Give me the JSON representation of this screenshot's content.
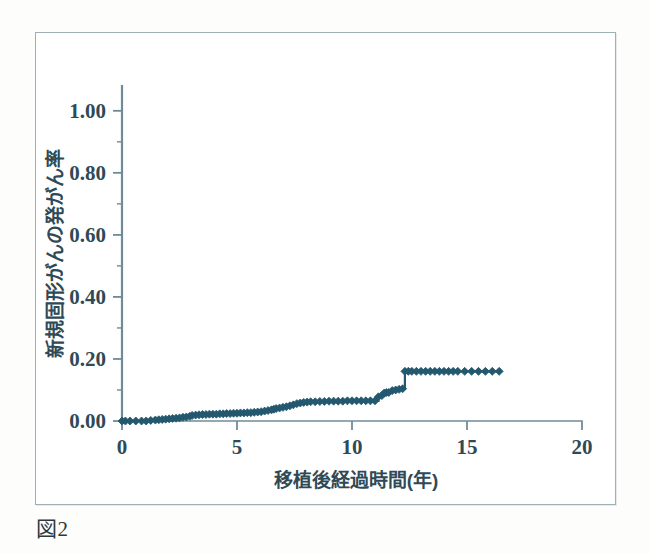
{
  "figure": {
    "caption": "図2"
  },
  "chart_data": {
    "type": "line",
    "subtype": "cumulative-incidence-step",
    "title": "",
    "subtitle": "",
    "xlabel": "移植後経過時間(年)",
    "ylabel": "新規固形がんの発がん率",
    "xlim": [
      0,
      20
    ],
    "ylim": [
      0.0,
      1.08
    ],
    "xticks": [
      0,
      5,
      10,
      15,
      20
    ],
    "xtick_labels": [
      "0",
      "5",
      "10",
      "15",
      "20"
    ],
    "yticks": [
      0.0,
      0.2,
      0.4,
      0.6,
      0.8,
      1.0
    ],
    "ytick_labels": [
      "0.00",
      "0.20",
      "0.40",
      "0.60",
      "0.80",
      "1.00"
    ],
    "yminor_ticks": [
      0.1,
      0.3,
      0.5,
      0.7,
      0.9
    ],
    "grid": false,
    "legend": null,
    "legend_position": "none",
    "marker": "diamond",
    "marker_size": 4,
    "line_width": 2.2,
    "series_color": "#23586f",
    "axis_color": "#6f8b96",
    "series": [
      {
        "name": "新規固形がんの累積発がん率",
        "x": [
          0.0,
          0.15,
          0.35,
          0.6,
          0.85,
          1.05,
          1.25,
          1.45,
          1.6,
          1.75,
          1.9,
          2.05,
          2.2,
          2.35,
          2.5,
          2.65,
          2.8,
          2.95,
          3.05,
          3.2,
          3.35,
          3.5,
          3.65,
          3.8,
          3.95,
          4.1,
          4.25,
          4.4,
          4.55,
          4.7,
          4.85,
          5.0,
          5.15,
          5.3,
          5.45,
          5.6,
          5.75,
          5.9,
          6.05,
          6.2,
          6.35,
          6.5,
          6.6,
          6.7,
          6.85,
          7.0,
          7.15,
          7.3,
          7.45,
          7.6,
          7.75,
          7.9,
          8.05,
          8.2,
          8.4,
          8.6,
          8.8,
          9.0,
          9.2,
          9.4,
          9.6,
          9.8,
          10.0,
          10.2,
          10.4,
          10.6,
          10.8,
          11.0,
          11.15,
          11.3,
          11.4,
          11.5,
          11.6,
          11.75,
          11.9,
          12.05,
          12.2,
          12.3,
          12.45,
          12.6,
          12.8,
          13.0,
          13.2,
          13.4,
          13.6,
          13.8,
          14.0,
          14.2,
          14.4,
          14.6,
          14.9,
          15.2,
          15.5,
          15.8,
          16.1,
          16.4
        ],
        "y": [
          0.0,
          0.0,
          0.0,
          0.0,
          0.0,
          0.0,
          0.002,
          0.003,
          0.004,
          0.005,
          0.006,
          0.007,
          0.008,
          0.009,
          0.01,
          0.012,
          0.013,
          0.015,
          0.018,
          0.019,
          0.02,
          0.021,
          0.021,
          0.022,
          0.022,
          0.022,
          0.023,
          0.023,
          0.024,
          0.024,
          0.025,
          0.025,
          0.026,
          0.026,
          0.027,
          0.027,
          0.028,
          0.029,
          0.03,
          0.032,
          0.034,
          0.036,
          0.038,
          0.04,
          0.042,
          0.044,
          0.046,
          0.049,
          0.052,
          0.056,
          0.058,
          0.06,
          0.061,
          0.062,
          0.062,
          0.063,
          0.063,
          0.064,
          0.064,
          0.064,
          0.064,
          0.065,
          0.065,
          0.065,
          0.065,
          0.065,
          0.065,
          0.065,
          0.078,
          0.082,
          0.09,
          0.092,
          0.092,
          0.098,
          0.1,
          0.102,
          0.104,
          0.16,
          0.16,
          0.16,
          0.16,
          0.16,
          0.16,
          0.16,
          0.16,
          0.16,
          0.16,
          0.16,
          0.16,
          0.16,
          0.16,
          0.16,
          0.16,
          0.16,
          0.16,
          0.16
        ]
      }
    ],
    "annotations": []
  }
}
